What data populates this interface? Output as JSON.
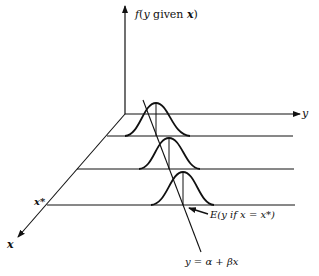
{
  "figure": {
    "type": "diagram",
    "labels": {
      "vertical_axis": "f(y given x)",
      "vertical_axis_f": "f",
      "vertical_axis_open": "(",
      "vertical_axis_y": "y",
      "vertical_axis_given": " given ",
      "vertical_axis_x": "x",
      "vertical_axis_close": ")",
      "y_axis": "y",
      "x_axis": "x",
      "x_star": "x*",
      "expectation": "E(y if x = x*)",
      "regression_line": "y = α + βx"
    },
    "distributions": [
      {
        "name": "distribution-1",
        "peak_x": 156,
        "baseline_y": 136
      },
      {
        "name": "distribution-2",
        "peak_x": 169,
        "baseline_y": 169
      },
      {
        "name": "distribution-3",
        "peak_x": 183,
        "baseline_y": 205
      }
    ],
    "colors": {
      "ink": "#111111",
      "background": "#ffffff"
    }
  }
}
